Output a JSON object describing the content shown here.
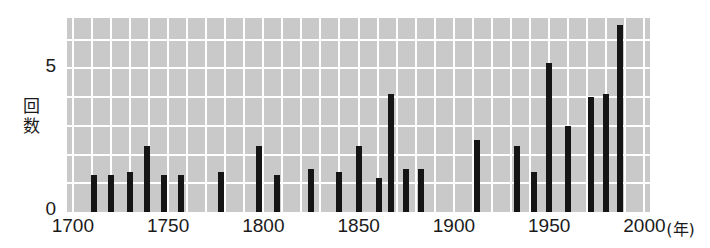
{
  "chart_data": {
    "type": "bar",
    "title": "",
    "subtitle": "",
    "xlabel": "年",
    "ylabel": "回数",
    "xlim": [
      1697,
      2003
    ],
    "ylim": [
      0,
      6.75
    ],
    "grid": true,
    "legend": null,
    "yticks": [
      0,
      5
    ],
    "yticklabels": [
      "0",
      "5"
    ],
    "xticks": [
      1700,
      1750,
      1800,
      1850,
      1900,
      1950,
      2000
    ],
    "xticklabels": [
      "1700",
      "1750",
      "1800",
      "1850",
      "1900",
      "1950",
      "2000"
    ],
    "x_unit_label": "(年)",
    "gridlines_y": [
      1,
      2,
      3,
      4,
      5,
      6
    ],
    "gridlines_x_step": 10,
    "bar_color": "#151515",
    "plot_background": "#c9c9c9",
    "grid_color": "#ffffff",
    "x": [
      1711,
      1720,
      1730,
      1739,
      1748,
      1757,
      1778,
      1798,
      1807,
      1825,
      1840,
      1850,
      1861,
      1867,
      1875,
      1883,
      1912,
      1933,
      1942,
      1950,
      1960,
      1972,
      1980,
      1987
    ],
    "values": [
      1.3,
      1.3,
      1.4,
      2.3,
      1.3,
      1.3,
      1.4,
      2.3,
      1.3,
      1.5,
      1.4,
      2.3,
      1.2,
      4.1,
      1.5,
      1.5,
      2.5,
      2.3,
      1.4,
      5.2,
      3.0,
      4.0,
      4.1,
      6.5
    ],
    "values_label": "回数"
  },
  "axes": {
    "y_title_chars": [
      "回",
      "数"
    ]
  }
}
